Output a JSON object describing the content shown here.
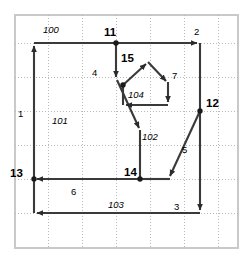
{
  "diagram": {
    "type": "directed-graph",
    "title": "",
    "colors": {
      "edge": "#3a3a3a",
      "grid": "#b9b9b9",
      "frame": "#c9c9c9",
      "node": "#1a1a1a",
      "background": "#ffffff"
    },
    "frame": {
      "x": 14,
      "y": 14,
      "width": 225,
      "height": 235
    },
    "grid": {
      "visible": true,
      "style": "dotted",
      "x_lines": [
        48,
        82,
        116,
        150,
        184,
        218
      ],
      "y_lines": [
        43,
        77,
        111,
        145,
        179,
        213
      ]
    },
    "nodes": [
      {
        "id": "n11",
        "label": "11",
        "x": 90,
        "y": 43,
        "dot": true,
        "label_dx": 8,
        "label_dy": -4
      },
      {
        "id": "n2",
        "label": "2",
        "x": 200,
        "y": 43,
        "dot": false,
        "label_dx": -2,
        "label_dy": -6
      },
      {
        "id": "n12",
        "label": "12",
        "x": 200,
        "y": 111,
        "dot": true,
        "label_dx": 7,
        "label_dy": -4
      },
      {
        "id": "n13",
        "label": "13",
        "x": 34,
        "y": 179,
        "dot": true,
        "label_dx": -26,
        "label_dy": -3
      },
      {
        "id": "n14",
        "label": "14",
        "x": 116,
        "y": 179,
        "dot": true,
        "label_dx": 5,
        "label_dy": -4
      },
      {
        "id": "n15",
        "label": "15",
        "x": 121,
        "y": 67,
        "dot": true,
        "label_dx": -22,
        "label_dy": -2
      },
      {
        "id": "n7",
        "label": "7",
        "x": 163,
        "y": 76,
        "dot": false,
        "label_dx": 6,
        "label_dy": 1
      },
      {
        "id": "n4",
        "label": "4",
        "x": 104,
        "y": 77,
        "dot": false,
        "label_dx": -13,
        "label_dy": -2
      },
      {
        "id": "n1",
        "label": "1",
        "x": 34,
        "y": 113,
        "dot": false,
        "label_dx": -15,
        "label_dy": 3
      },
      {
        "id": "n5",
        "label": "5",
        "x": 178,
        "y": 148,
        "dot": false,
        "label_dx": 5,
        "label_dy": 2
      },
      {
        "id": "n6",
        "label": "6",
        "x": 75,
        "y": 179,
        "dot": false,
        "label_dx": -2,
        "label_dy": 14
      },
      {
        "id": "n3",
        "label": "3",
        "x": 178,
        "y": 213,
        "dot": false,
        "label_dx": -2,
        "label_dy": -5
      }
    ],
    "edge_labels": [
      {
        "id": "e100",
        "label": "100",
        "x": 46,
        "y": 30
      },
      {
        "id": "e11",
        "label": "11",
        "x": 98,
        "y": 36
      },
      {
        "id": "e2",
        "label": "2",
        "x": 198,
        "y": 34
      },
      {
        "id": "e15",
        "label": "15",
        "x": 99,
        "y": 64
      },
      {
        "id": "e7",
        "label": "7",
        "x": 169,
        "y": 77
      },
      {
        "id": "e4",
        "label": "4",
        "x": 91,
        "y": 74
      },
      {
        "id": "e12",
        "label": "12",
        "x": 207,
        "y": 106
      },
      {
        "id": "e1",
        "label": "1",
        "x": 19,
        "y": 115
      },
      {
        "id": "e5",
        "label": "5",
        "x": 183,
        "y": 150
      },
      {
        "id": "e13",
        "label": "13",
        "x": 8,
        "y": 175
      },
      {
        "id": "e14",
        "label": "14",
        "x": 121,
        "y": 175
      },
      {
        "id": "e6",
        "label": "6",
        "x": 73,
        "y": 193
      },
      {
        "id": "e3",
        "label": "3",
        "x": 176,
        "y": 208
      }
    ],
    "face_labels": [
      {
        "id": "f100",
        "label": "100",
        "x": 46,
        "y": 30
      },
      {
        "id": "f101",
        "label": "101",
        "x": 56,
        "y": 121
      },
      {
        "id": "f102",
        "label": "102",
        "x": 146,
        "y": 137
      },
      {
        "id": "f103",
        "label": "103",
        "x": 112,
        "y": 205
      },
      {
        "id": "f104",
        "label": "104",
        "x": 138,
        "y": 93
      }
    ],
    "edges": [
      {
        "id": "edge-1",
        "name": "left-boundary-up",
        "from": "bottom-left",
        "to": "n-top-left",
        "points": "34,213 34,43",
        "arrow_at": "34,43",
        "arrow_dir": "up"
      },
      {
        "id": "edge-100",
        "name": "top-boundary-right",
        "from": "n-top-left",
        "to": "n2",
        "points": "34,43 200,43",
        "arrow_at": "200,43",
        "arrow_dir": "right"
      },
      {
        "id": "edge-2",
        "name": "right-boundary-down",
        "from": "n2",
        "to": "bottom-right",
        "points": "200,43 200,213",
        "arrow_at": "200,213",
        "arrow_dir": "down"
      },
      {
        "id": "edge-3",
        "name": "bottom-boundary-left",
        "from": "bottom-right",
        "to": "bottom-left",
        "points": "200,213 34,213",
        "arrow_at": "34,213",
        "arrow_dir": "left"
      },
      {
        "id": "edge-4a",
        "name": "n11-down-to-4",
        "from": "n11",
        "to": "n4",
        "points": "116,43 116,80",
        "arrow_at": "116,80",
        "arrow_dir": "down"
      },
      {
        "id": "edge-4b",
        "name": "n4-diagonal-down",
        "from": "n4",
        "to": "mid-junction",
        "points": "116,80 140,131",
        "arrow_at": "140,131",
        "arrow_dir": "down-right"
      },
      {
        "id": "edge-4c",
        "name": "junction-down-to-n14",
        "from": "mid-junction",
        "to": "n14",
        "points": "140,131 140,179",
        "arrow_at": "",
        "arrow_dir": "none"
      },
      {
        "id": "edge-6",
        "name": "n14-left-to-n13",
        "from": "n14",
        "to": "n13",
        "points": "140,179 34,179",
        "arrow_at": "34,179",
        "arrow_dir": "left"
      },
      {
        "id": "edge-5a",
        "name": "n12-diagonal-down-left",
        "from": "n12",
        "to": "n14-right",
        "points": "200,111 168,179",
        "arrow_at": "168,179",
        "arrow_dir": "down-left"
      },
      {
        "id": "edge-5b",
        "name": "n14-right-horizontal",
        "from": "n14",
        "to": "n14-right",
        "points": "140,179 168,179",
        "arrow_at": "",
        "arrow_dir": "none"
      },
      {
        "id": "edge-15a",
        "name": "n15-up-to-apex",
        "from": "n15",
        "to": "pentagon-apex",
        "points": "123,84 148,62",
        "arrow_at": "148,62",
        "arrow_dir": "up-right"
      },
      {
        "id": "edge-7",
        "name": "apex-down-right-to-7",
        "from": "pentagon-apex",
        "to": "n7",
        "points": "148,62 168,84",
        "arrow_at": "168,84",
        "arrow_dir": "down-right"
      },
      {
        "id": "edge-7b",
        "name": "n7-down",
        "from": "n7",
        "to": "pentagon-br",
        "points": "168,84 168,105",
        "arrow_at": "168,105",
        "arrow_dir": "down"
      },
      {
        "id": "edge-104",
        "name": "pentagon-bottom-left",
        "from": "pentagon-br",
        "to": "pentagon-bl",
        "points": "168,105 123,105",
        "arrow_at": "123,105",
        "arrow_dir": "left"
      },
      {
        "id": "edge-104b",
        "name": "pentagon-left-side",
        "from": "pentagon-bl",
        "to": "n15",
        "points": "123,105 123,84",
        "arrow_at": "",
        "arrow_dir": "none"
      }
    ]
  }
}
